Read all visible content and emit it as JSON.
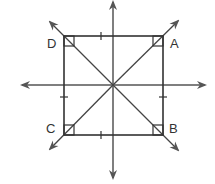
{
  "diagram": {
    "type": "geometry",
    "colors": {
      "stroke": "#333333",
      "arrow": "#555555",
      "background": "#ffffff"
    },
    "square": {
      "vertices": {
        "A": {
          "label": "A",
          "x": 163,
          "y": 36
        },
        "B": {
          "label": "B",
          "x": 163,
          "y": 135
        },
        "C": {
          "label": "C",
          "x": 64,
          "y": 135
        },
        "D": {
          "label": "D",
          "x": 64,
          "y": 36
        }
      },
      "right_angle_marks": [
        "A",
        "B",
        "C",
        "D"
      ],
      "congruence_ticks": [
        "top",
        "bottom",
        "left",
        "right"
      ]
    },
    "axes": {
      "vertical": {
        "x": 113,
        "y1": 2,
        "y2": 178
      },
      "horizontal": {
        "y": 85,
        "x1": 22,
        "x2": 205
      }
    },
    "diagonals": [
      {
        "name": "line-DB",
        "from": "NW",
        "to": "SE"
      },
      {
        "name": "line-CA",
        "from": "SW",
        "to": "NE"
      }
    ],
    "labels": {
      "A": "A",
      "B": "B",
      "C": "C",
      "D": "D"
    }
  }
}
